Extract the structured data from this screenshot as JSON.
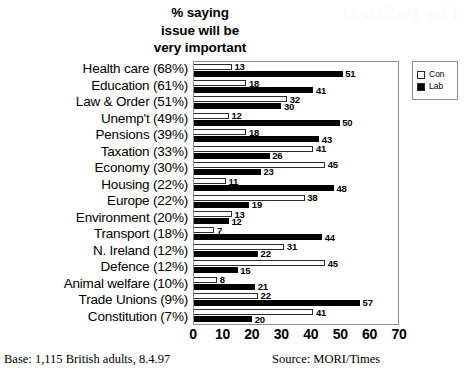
{
  "ghost_text": "The Political",
  "title_lines": [
    "% saying",
    "issue will be",
    "very important"
  ],
  "title_text": "% saying issue will be very important",
  "legend": {
    "items": [
      {
        "label": "Con",
        "swatch": "white-square-icon",
        "color": "#ffffff"
      },
      {
        "label": "Lab",
        "swatch": "black-square-icon",
        "color": "#000000"
      }
    ]
  },
  "footer": {
    "base": "Base: 1,115 British adults, 8.4.97",
    "source": "Source: MORI/Times"
  },
  "chart_data": {
    "type": "bar",
    "orientation": "horizontal",
    "title": "% saying issue will be very important",
    "xlabel": "",
    "ylabel": "",
    "xlim": [
      0,
      70
    ],
    "xticks": [
      0,
      10,
      20,
      30,
      40,
      50,
      60,
      70
    ],
    "grid": false,
    "legend_position": "top-right-outside",
    "categories": [
      "Health care (68%)",
      "Education (61%)",
      "Law & Order (51%)",
      "Unemp't (49%)",
      "Pensions (39%)",
      "Taxation (33%)",
      "Economy (30%)",
      "Housing (22%)",
      "Europe (22%)",
      "Environment (20%)",
      "Transport (18%)",
      "N. Ireland (12%)",
      "Defence (12%)",
      "Animal welfare (10%)",
      "Trade Unions (9%)",
      "Constitution (7%)"
    ],
    "series": [
      {
        "name": "Con",
        "color": "#ffffff",
        "values": [
          13,
          18,
          32,
          12,
          18,
          41,
          45,
          11,
          38,
          13,
          7,
          31,
          45,
          8,
          22,
          41
        ]
      },
      {
        "name": "Lab",
        "color": "#000000",
        "values": [
          51,
          41,
          30,
          50,
          43,
          26,
          23,
          48,
          19,
          12,
          44,
          22,
          15,
          21,
          57,
          20
        ]
      }
    ]
  }
}
